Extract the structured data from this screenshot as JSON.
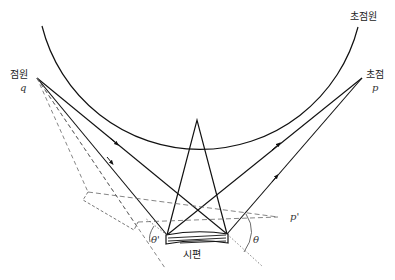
{
  "diagram": {
    "type": "X-ray diffraction focusing circle geometry (Bragg-Brentano)",
    "labels": {
      "focusing_circle": "초점원",
      "source_point": "점원",
      "source_symbol": "q",
      "focus_point": "초점",
      "focus_symbol": "p",
      "focus_prime": "p'",
      "specimen": "시편",
      "theta": "θ",
      "theta_prime": "θ'"
    },
    "colors": {
      "line": "#111111",
      "dashed": "#555555",
      "background": "#ffffff"
    },
    "points": {
      "q": [
        37,
        78
      ],
      "p": [
        362,
        78
      ],
      "apex": [
        197,
        120
      ],
      "specimen_left": [
        167,
        235
      ],
      "specimen_right": [
        227,
        234
      ],
      "p_prime": [
        278,
        217
      ]
    }
  }
}
